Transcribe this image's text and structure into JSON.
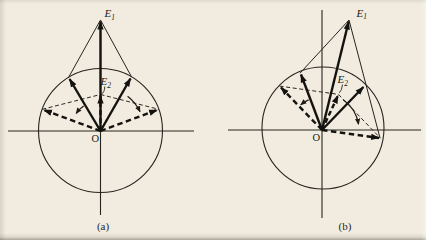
{
  "page": {
    "background_color": "#f1ecdf",
    "ink_color": "#26241f",
    "bold_ink_color": "#14130f"
  },
  "figure": {
    "type": "phasor-addition-diagram",
    "panels": [
      {
        "caption": "(a)",
        "origin_label": "O",
        "e1_label": "E",
        "e1_sub": "1",
        "e2_label": "E",
        "e2_sub": "2"
      },
      {
        "caption": "(b)",
        "origin_label": "O",
        "e1_label": "E",
        "e1_sub": "1",
        "e2_label": "E",
        "e2_sub": "2"
      }
    ]
  },
  "diagram_data": {
    "description": "Two equal-amplitude phasors drawn from origin O on a reference circle. Solid bold phasors add (parallelogram, thin solid lines) to resultant E1; at a later phase the phasors (bold dashed, rotated outward as shown by small curved arrows) add via thin dashed parallelogram lines to the shorter resultant E2.",
    "panels": [
      {
        "name": "a",
        "circle_radius_px": 62,
        "solid_phasor_angles_deg": [
          120,
          60
        ],
        "resultant_e1": {
          "angle_deg": 90,
          "length_in_radii": 1.79
        },
        "dashed_phasor_angles_deg": [
          160,
          20
        ],
        "resultant_e2": {
          "angle_deg": 90,
          "length_in_radii": 0.58
        },
        "rotation_arrows": "both outer arcs point away from E1 direction"
      },
      {
        "name": "b",
        "circle_radius_px": 61,
        "solid_phasor_angles_deg": [
          111,
          46
        ],
        "resultant_e1": {
          "angle_deg": 76,
          "length_in_radii": 1.85
        },
        "dashed_phasor_angles_deg": [
          134,
          -8
        ],
        "resultant_e2": {
          "angle_deg": 65,
          "length_in_radii": 0.64
        },
        "rotation_arrows": "both outer arcs point away from E1 direction"
      }
    ]
  }
}
